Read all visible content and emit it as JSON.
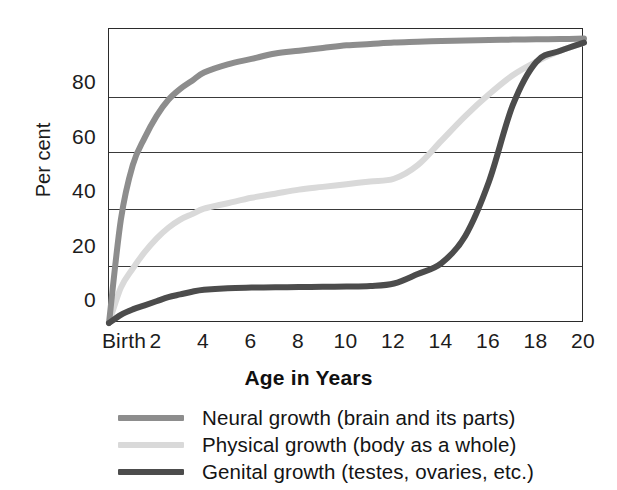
{
  "chart_data": {
    "type": "line",
    "title": "",
    "xlabel": "Age in Years",
    "ylabel": "Per cent",
    "xlim": [
      0,
      20
    ],
    "ylim": [
      -8,
      100
    ],
    "grid": true,
    "grid_values": [
      13,
      34,
      55,
      75
    ],
    "legend_position": "below",
    "x_tick_labels": [
      "Birth",
      "2",
      "4",
      "6",
      "8",
      "10",
      "12",
      "14",
      "16",
      "18",
      "20"
    ],
    "x_tick_values": [
      0,
      2,
      4,
      6,
      8,
      10,
      12,
      14,
      16,
      18,
      20
    ],
    "y_tick_labels": [
      "0",
      "20",
      "40",
      "60",
      "80"
    ],
    "y_tick_values": [
      0,
      20,
      40,
      60,
      80
    ],
    "x": [
      0,
      0.5,
      1,
      1.5,
      2,
      2.5,
      3,
      3.5,
      4,
      5,
      6,
      7,
      8,
      9,
      10,
      11,
      12,
      13,
      14,
      15,
      16,
      17,
      18,
      19,
      20
    ],
    "series": [
      {
        "name": "Neural growth (brain and its parts)",
        "color": "#8d8d8d",
        "values": [
          -8,
          30,
          50,
          60,
          68,
          74,
          78,
          81,
          84,
          87,
          89,
          91,
          92,
          93,
          94,
          94.5,
          95,
          95.3,
          95.6,
          95.8,
          96,
          96.1,
          96.2,
          96.3,
          96.5
        ]
      },
      {
        "name": "Physical growth (body as a whole)",
        "color": "#d9d9d9",
        "values": [
          -8,
          5,
          12,
          18,
          23,
          27,
          30,
          32,
          34,
          36,
          38,
          39.5,
          41,
          42,
          43,
          44,
          45,
          50,
          59,
          68,
          76,
          83,
          88,
          92,
          95
        ]
      },
      {
        "name": "Genital growth (testes, ovaries, etc.)",
        "color": "#4c4c4c",
        "values": [
          -8,
          -5,
          -3,
          -1.5,
          0,
          1.5,
          2.5,
          3.5,
          4.2,
          4.8,
          5,
          5.1,
          5.2,
          5.3,
          5.4,
          5.6,
          6.5,
          10,
          14,
          24,
          44,
          72,
          88,
          92,
          95
        ]
      }
    ]
  },
  "axes": {
    "y_label": "Per cent",
    "x_label": "Age in Years"
  },
  "colors": {
    "neural": "#8d8d8d",
    "physical": "#d9d9d9",
    "genital": "#4c4c4c",
    "axis": "#2b2b2b",
    "grid": "#3a3a3a",
    "text": "#1c1c1c",
    "background": "#ffffff"
  }
}
